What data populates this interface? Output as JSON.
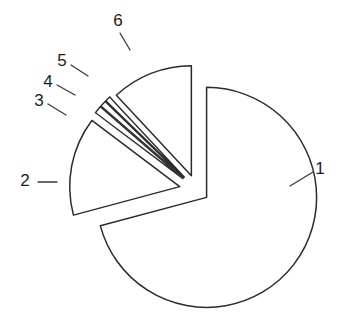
{
  "chart_data": {
    "type": "pie",
    "title": "",
    "subtitle": "",
    "xlabel": "",
    "ylabel": "",
    "legend_position": "none",
    "grid": false,
    "exploded": true,
    "style": "line-art outline, unfilled wedges, black stroke on white",
    "center": {
      "x": 197,
      "y": 190
    },
    "radius": 110,
    "start_angle_deg": -90,
    "direction": "clockwise",
    "labels": [
      "1",
      "2",
      "3",
      "4",
      "5",
      "6"
    ],
    "categories": [
      "1",
      "2",
      "3",
      "4",
      "5",
      "6"
    ],
    "values": [
      70.8,
      14.4,
      1.1,
      0.9,
      0.8,
      12.0
    ],
    "units": "percent",
    "slices": [
      {
        "label": "1",
        "value": 70.8,
        "angle_deg": 255,
        "start_deg": -90,
        "end_deg": 165,
        "explode": 0.11,
        "label_x": 320,
        "label_y": 170,
        "leader_x1": 290,
        "leader_y1": 186,
        "leader_x2": 313,
        "leader_y2": 172
      },
      {
        "label": "2",
        "value": 14.4,
        "angle_deg": 52,
        "start_deg": 165,
        "end_deg": 217,
        "explode": 0.16,
        "label_x": 25,
        "label_y": 182,
        "leader_x1": 38,
        "leader_y1": 182,
        "leader_x2": 57,
        "leader_y2": 182
      },
      {
        "label": "3",
        "value": 1.1,
        "angle_deg": 4,
        "start_deg": 217,
        "end_deg": 221,
        "explode": 0.16,
        "label_x": 39,
        "label_y": 102,
        "leader_x1": 48,
        "leader_y1": 104,
        "leader_x2": 66,
        "leader_y2": 115
      },
      {
        "label": "4",
        "value": 0.9,
        "angle_deg": 3.2,
        "start_deg": 221,
        "end_deg": 224.2,
        "explode": 0.16,
        "label_x": 48,
        "label_y": 83,
        "leader_x1": 57,
        "leader_y1": 85,
        "leader_x2": 75,
        "leader_y2": 95
      },
      {
        "label": "5",
        "value": 0.8,
        "angle_deg": 2.8,
        "start_deg": 224.2,
        "end_deg": 227,
        "explode": 0.16,
        "label_x": 62,
        "label_y": 62,
        "leader_x1": 71,
        "leader_y1": 65,
        "leader_x2": 88,
        "leader_y2": 76
      },
      {
        "label": "6",
        "value": 12.0,
        "angle_deg": 43,
        "start_deg": 227,
        "end_deg": 270,
        "explode": 0.14,
        "label_x": 118,
        "label_y": 22,
        "leader_x1": 120,
        "leader_y1": 33,
        "leader_x2": 130,
        "leader_y2": 50
      }
    ]
  },
  "figure": {
    "background_color": "#ffffff",
    "stroke_color": "#2b2b2b",
    "label_color": "#1c1c1c"
  }
}
